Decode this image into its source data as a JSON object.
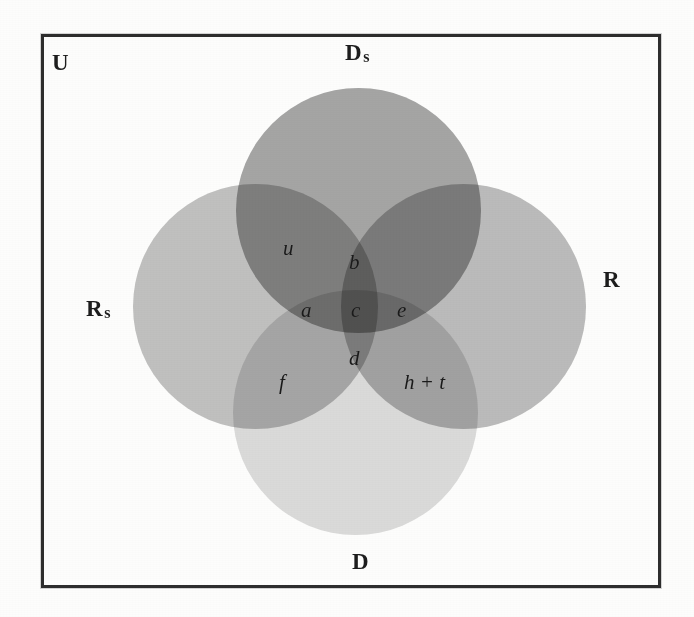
{
  "diagram": {
    "type": "venn",
    "universe_label": "U",
    "sets": [
      {
        "id": "ds",
        "label_main": "D",
        "label_sub": "s",
        "position": "top",
        "fill": "#a6a6a6"
      },
      {
        "id": "rs",
        "label_main": "R",
        "label_sub": "s",
        "position": "left",
        "fill": "#c2c2c2"
      },
      {
        "id": "r",
        "label_main": "R",
        "label_sub": "",
        "position": "right",
        "fill": "#bdbdbd"
      },
      {
        "id": "d",
        "label_main": "D",
        "label_sub": "",
        "position": "bottom",
        "fill": "#dcdcdc"
      }
    ],
    "regions": [
      {
        "id": "u",
        "label": "u",
        "note": "Ds only / Ds ∩ Rs upper"
      },
      {
        "id": "b",
        "label": "b",
        "note": "Ds ∩ Rs ∩ R upper"
      },
      {
        "id": "a",
        "label": "a",
        "note": "Ds ∩ Rs"
      },
      {
        "id": "c",
        "label": "c",
        "note": "Ds ∩ Rs ∩ R ∩ D"
      },
      {
        "id": "e",
        "label": "e",
        "note": "Ds ∩ R"
      },
      {
        "id": "d",
        "label": "d",
        "note": "Rs ∩ R ∩ D"
      },
      {
        "id": "f",
        "label": "f",
        "note": "Rs ∩ D"
      },
      {
        "id": "ht",
        "label": "h + t",
        "note": "R ∩ D"
      }
    ],
    "frame": {
      "border_color": "#2e2e2e",
      "background": "#fdfdfc"
    }
  }
}
